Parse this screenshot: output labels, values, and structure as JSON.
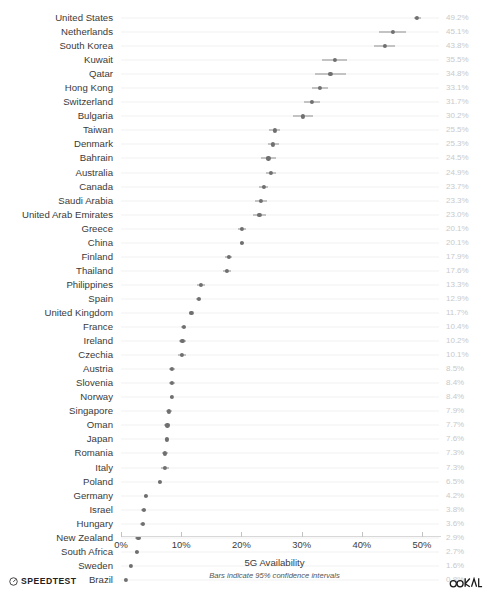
{
  "chart_data": {
    "type": "scatter",
    "title": "",
    "xlabel": "5G Availability",
    "ylabel": "",
    "note": "Bars indicate 95% confidence intervals",
    "xlim": [
      0,
      53.3
    ],
    "xticks": [
      0,
      10,
      20,
      30,
      40,
      50
    ],
    "xtick_labels": [
      "0%",
      "10%",
      "20%",
      "30%",
      "40%",
      "50%"
    ],
    "grid": true,
    "legend": null,
    "value_label_suffix": "%",
    "categories": [
      "United States",
      "Netherlands",
      "South Korea",
      "Kuwait",
      "Qatar",
      "Hong Kong",
      "Switzerland",
      "Bulgaria",
      "Taiwan",
      "Denmark",
      "Bahrain",
      "Australia",
      "Canada",
      "Saudi Arabia",
      "United Arab Emirates",
      "Greece",
      "China",
      "Finland",
      "Thailand",
      "Philippines",
      "Spain",
      "United Kingdom",
      "France",
      "Ireland",
      "Czechia",
      "Austria",
      "Slovenia",
      "Norway",
      "Singapore",
      "Oman",
      "Japan",
      "Romania",
      "Italy",
      "Poland",
      "Germany",
      "Israel",
      "Hungary",
      "New Zealand",
      "South Africa",
      "Sweden",
      "Brazil"
    ],
    "values": [
      49.2,
      45.1,
      43.8,
      35.5,
      34.8,
      33.1,
      31.7,
      30.2,
      25.5,
      25.3,
      24.5,
      24.9,
      23.7,
      23.3,
      23.0,
      20.1,
      20.1,
      17.9,
      17.6,
      13.3,
      12.9,
      11.7,
      10.4,
      10.2,
      10.1,
      8.5,
      8.4,
      8.4,
      7.9,
      7.7,
      7.6,
      7.3,
      7.3,
      6.5,
      4.2,
      3.8,
      3.6,
      2.9,
      2.7,
      1.6,
      0.8
    ],
    "value_labels": [
      "49.2%",
      "45.1%",
      "43.8%",
      "35.5%",
      "34.8%",
      "33.1%",
      "31.7%",
      "30.2%",
      "25.5%",
      "25.3%",
      "24.5%",
      "24.9%",
      "23.7%",
      "23.3%",
      "23.0%",
      "20.1%",
      "20.1%",
      "17.9%",
      "17.6%",
      "13.3%",
      "12.9%",
      "11.7%",
      "10.4%",
      "10.2%",
      "10.1%",
      "8.5%",
      "8.4%",
      "8.4%",
      "7.9%",
      "7.7%",
      "7.6%",
      "7.3%",
      "7.3%",
      "6.5%",
      "4.2%",
      "3.8%",
      "3.6%",
      "2.9%",
      "2.7%",
      "1.6%",
      "0.8%"
    ],
    "ci_low": [
      48.6,
      42.9,
      42.1,
      33.4,
      32.2,
      31.8,
      30.4,
      28.5,
      24.6,
      24.4,
      23.3,
      24.1,
      23.0,
      22.3,
      21.9,
      19.4,
      19.8,
      17.3,
      17.0,
      12.6,
      12.5,
      11.4,
      10.0,
      9.6,
      9.4,
      8.0,
      7.9,
      8.1,
      7.4,
      7.2,
      7.3,
      6.8,
      6.7,
      6.2,
      3.9,
      3.4,
      3.2,
      2.4,
      2.4,
      1.4,
      0.7
    ],
    "ci_high": [
      49.8,
      47.3,
      45.5,
      37.6,
      37.4,
      34.4,
      33.0,
      31.9,
      26.4,
      26.2,
      25.7,
      25.7,
      24.4,
      24.3,
      24.1,
      20.8,
      20.4,
      18.5,
      18.2,
      14.0,
      13.3,
      12.0,
      10.8,
      10.8,
      10.8,
      9.0,
      8.9,
      8.7,
      8.4,
      8.2,
      7.9,
      7.8,
      7.9,
      6.8,
      4.5,
      4.2,
      4.0,
      3.4,
      3.0,
      1.8,
      0.9
    ],
    "colors": {
      "dot": "#6f6f6f",
      "error_bar": "#8e8e8e",
      "gridline": "#f2f2f2",
      "label": "#3a3a3a",
      "value_label": "#c9c9c9",
      "background": "#ffffff"
    }
  },
  "footer": {
    "speedtest_brand": "SPEEDTEST",
    "speedtest_icon": "speedometer-icon",
    "ookla_brand": "OOKLA",
    "ookla_icon": "ookla-logo-icon"
  }
}
